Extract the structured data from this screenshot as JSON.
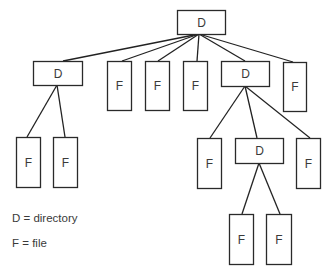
{
  "diagram": {
    "type": "tree",
    "colors": {
      "line": "#222222",
      "box_stroke": "#2a2a2a",
      "box_fill": "#ffffff",
      "text": "#3a3a3a"
    },
    "nodes": [
      {
        "id": "root",
        "label": "D",
        "kind": "directory",
        "x": 177,
        "y": 10,
        "w": 48,
        "h": 24
      },
      {
        "id": "d1",
        "label": "D",
        "kind": "directory",
        "x": 33,
        "y": 61,
        "w": 49,
        "h": 24
      },
      {
        "id": "f1",
        "label": "F",
        "kind": "file",
        "x": 107,
        "y": 61,
        "w": 24,
        "h": 49
      },
      {
        "id": "f2",
        "label": "F",
        "kind": "file",
        "x": 145,
        "y": 61,
        "w": 24,
        "h": 49
      },
      {
        "id": "f3",
        "label": "F",
        "kind": "file",
        "x": 183,
        "y": 61,
        "w": 24,
        "h": 49
      },
      {
        "id": "d2",
        "label": "D",
        "kind": "directory",
        "x": 221,
        "y": 61,
        "w": 48,
        "h": 25
      },
      {
        "id": "f4",
        "label": "F",
        "kind": "file",
        "x": 283,
        "y": 62,
        "w": 23,
        "h": 49
      },
      {
        "id": "f5",
        "label": "F",
        "kind": "file",
        "x": 16,
        "y": 137,
        "w": 24,
        "h": 50
      },
      {
        "id": "f6",
        "label": "F",
        "kind": "file",
        "x": 53,
        "y": 137,
        "w": 24,
        "h": 50
      },
      {
        "id": "f7",
        "label": "F",
        "kind": "file",
        "x": 197,
        "y": 138,
        "w": 24,
        "h": 50
      },
      {
        "id": "d3",
        "label": "D",
        "kind": "directory",
        "x": 235,
        "y": 138,
        "w": 48,
        "h": 25
      },
      {
        "id": "f8",
        "label": "F",
        "kind": "file",
        "x": 296,
        "y": 138,
        "w": 24,
        "h": 50
      },
      {
        "id": "f9",
        "label": "F",
        "kind": "file",
        "x": 229,
        "y": 214,
        "w": 24,
        "h": 50
      },
      {
        "id": "f10",
        "label": "F",
        "kind": "file",
        "x": 266,
        "y": 214,
        "w": 25,
        "h": 50
      }
    ],
    "edges": [
      {
        "from": "root",
        "to": "d1",
        "x1": 199,
        "y1": 34,
        "x2": 63,
        "y2": 61
      },
      {
        "from": "root",
        "to": "f1",
        "x1": 199,
        "y1": 34,
        "x2": 122,
        "y2": 61
      },
      {
        "from": "root",
        "to": "f2",
        "x1": 199,
        "y1": 34,
        "x2": 158,
        "y2": 61
      },
      {
        "from": "root",
        "to": "f3",
        "x1": 199,
        "y1": 34,
        "x2": 197,
        "y2": 61
      },
      {
        "from": "root",
        "to": "d2",
        "x1": 199,
        "y1": 34,
        "x2": 245,
        "y2": 61
      },
      {
        "from": "root",
        "to": "f4",
        "x1": 199,
        "y1": 34,
        "x2": 293,
        "y2": 62
      },
      {
        "from": "d1",
        "to": "f5",
        "x1": 57,
        "y1": 85,
        "x2": 27,
        "y2": 137
      },
      {
        "from": "d1",
        "to": "f6",
        "x1": 57,
        "y1": 85,
        "x2": 65,
        "y2": 137
      },
      {
        "from": "d2",
        "to": "f7",
        "x1": 245,
        "y1": 86,
        "x2": 210,
        "y2": 138
      },
      {
        "from": "d2",
        "to": "d3",
        "x1": 245,
        "y1": 86,
        "x2": 257,
        "y2": 138
      },
      {
        "from": "d2",
        "to": "f8",
        "x1": 245,
        "y1": 86,
        "x2": 310,
        "y2": 138
      },
      {
        "from": "d3",
        "to": "f9",
        "x1": 259,
        "y1": 163,
        "x2": 242,
        "y2": 214
      },
      {
        "from": "d3",
        "to": "f10",
        "x1": 259,
        "y1": 163,
        "x2": 280,
        "y2": 214
      }
    ]
  },
  "legend": {
    "items": [
      {
        "text": "D = directory",
        "top": 212
      },
      {
        "text": "F = file",
        "top": 237
      }
    ]
  }
}
